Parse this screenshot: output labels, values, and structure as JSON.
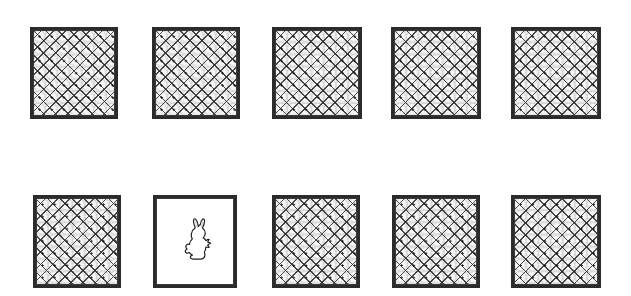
{
  "scene": {
    "title": "Row of animal cages with wire mesh",
    "width": 631,
    "height": 296,
    "background_color": "#ffffff",
    "frame_color": "#2b2b2b",
    "mesh_color": "#282828",
    "mesh_fill_color": "#f7f7f7",
    "empty_fill_color": "#ffffff",
    "rows": 2,
    "columns": 5,
    "total_cages": 10,
    "mesh_cage_count": 9,
    "empty_cage_count": 1,
    "occupant_count": 1
  },
  "cages": [
    {
      "id": "cage-r1-c1",
      "label": "Cage row 1 column 1",
      "row": 1,
      "column": 1,
      "x": 30,
      "y": 27,
      "width": 88,
      "height": 92,
      "fill": "mesh",
      "state": "meshed",
      "occupant": "none"
    },
    {
      "id": "cage-r1-c2",
      "label": "Cage row 1 column 2",
      "row": 1,
      "column": 2,
      "x": 152,
      "y": 27,
      "width": 88,
      "height": 92,
      "fill": "mesh",
      "state": "meshed",
      "occupant": "none"
    },
    {
      "id": "cage-r1-c3",
      "label": "Cage row 1 column 3",
      "row": 1,
      "column": 3,
      "x": 272,
      "y": 27,
      "width": 90,
      "height": 92,
      "fill": "mesh",
      "state": "meshed",
      "occupant": "none"
    },
    {
      "id": "cage-r1-c4",
      "label": "Cage row 1 column 4",
      "row": 1,
      "column": 4,
      "x": 391,
      "y": 27,
      "width": 90,
      "height": 92,
      "fill": "mesh",
      "state": "meshed",
      "occupant": "none"
    },
    {
      "id": "cage-r1-c5",
      "label": "Cage row 1 column 5",
      "row": 1,
      "column": 5,
      "x": 511,
      "y": 27,
      "width": 90,
      "height": 92,
      "fill": "mesh",
      "state": "meshed",
      "occupant": "none"
    },
    {
      "id": "cage-r2-c1",
      "label": "Cage row 2 column 1",
      "row": 2,
      "column": 1,
      "x": 33,
      "y": 195,
      "width": 88,
      "height": 93,
      "fill": "mesh",
      "state": "meshed",
      "occupant": "none"
    },
    {
      "id": "cage-r2-c2",
      "label": "Cage row 2 column 2 with rabbit",
      "row": 2,
      "column": 2,
      "x": 153,
      "y": 195,
      "width": 84,
      "height": 93,
      "fill": "empty",
      "state": "open",
      "occupant": "rabbit"
    },
    {
      "id": "cage-r2-c3",
      "label": "Cage row 2 column 3",
      "row": 2,
      "column": 3,
      "x": 272,
      "y": 195,
      "width": 88,
      "height": 93,
      "fill": "mesh",
      "state": "meshed",
      "occupant": "none"
    },
    {
      "id": "cage-r2-c4",
      "label": "Cage row 2 column 4",
      "row": 2,
      "column": 4,
      "x": 392,
      "y": 195,
      "width": 88,
      "height": 93,
      "fill": "mesh",
      "state": "meshed",
      "occupant": "none"
    },
    {
      "id": "cage-r2-c5",
      "label": "Cage row 2 column 5",
      "row": 2,
      "column": 5,
      "x": 511,
      "y": 195,
      "width": 90,
      "height": 93,
      "fill": "mesh",
      "state": "meshed",
      "occupant": "none"
    }
  ],
  "occupant": {
    "name": "rabbit",
    "style": "outline silhouette",
    "in_cage": "cage-r2-c2",
    "x": 185,
    "y": 218,
    "width": 28,
    "height": 44,
    "stroke_color": "#1f1f1f",
    "fill_color": "#ffffff"
  }
}
